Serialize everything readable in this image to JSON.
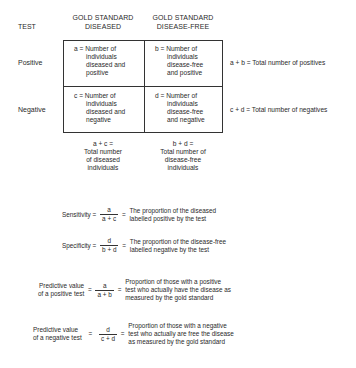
{
  "headers": {
    "test": "TEST",
    "col1_line1": "GOLD STANDARD",
    "col1_line2": "DISEASED",
    "col2_line1": "GOLD STANDARD",
    "col2_line2": "DISEASE-FREE"
  },
  "rows": [
    {
      "label": "Positive",
      "cells": [
        {
          "lines": [
            "a = Number of",
            "individuals",
            "diseased and",
            "positive"
          ]
        },
        {
          "lines": [
            "b = Number of",
            "individuals",
            "disease-free",
            "and positive"
          ]
        }
      ],
      "total": "a + b = Total number of positives"
    },
    {
      "label": "Negative",
      "cells": [
        {
          "lines": [
            "c = Number of",
            "individuals",
            "diseased and",
            "negative"
          ]
        },
        {
          "lines": [
            "d = Number of",
            "individuals",
            "disease-free",
            "and negative"
          ]
        }
      ],
      "total": "c + d = Total number of negatives"
    }
  ],
  "column_totals": [
    {
      "lines": [
        "a + c =",
        "Total number",
        "of diseased",
        "individuals"
      ]
    },
    {
      "lines": [
        "b + d =",
        "Total number of",
        "disease-free",
        "individuals"
      ]
    }
  ],
  "formulas": [
    {
      "name_lines": [
        "Sensitivity ="
      ],
      "numerator": "a",
      "denominator": "a + c",
      "equals": "=",
      "desc_lines": [
        "The proportion of the diseased",
        "labelled positive by the test"
      ]
    },
    {
      "name_lines": [
        "Specificity ="
      ],
      "numerator": "d",
      "denominator": "b + d",
      "equals": "=",
      "desc_lines": [
        "The proportion of the disease-free",
        "labelled negative by the test"
      ]
    },
    {
      "name_lines": [
        "Predictive value",
        "of a positive test"
      ],
      "pre_equals": "=",
      "numerator": "a",
      "denominator": "a + b",
      "equals": "=",
      "desc_lines": [
        "Proportion of those with a positive",
        "test who actually have the disease as",
        "measured by the gold standard"
      ]
    },
    {
      "name_lines": [
        "Predictive value",
        "of a negative test"
      ],
      "pre_equals": "=",
      "numerator": "d",
      "denominator": "c + d",
      "equals": "=",
      "desc_lines": [
        "Proportion of those with a negative",
        "test who actually are free  the disease",
        "as measured by the gold standard"
      ]
    }
  ]
}
